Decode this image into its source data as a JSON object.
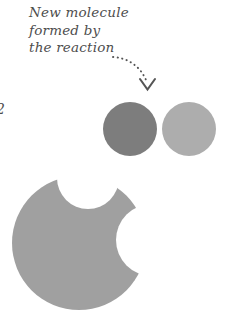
{
  "canvas": {
    "width": 227,
    "height": 318,
    "background": "#ffffff"
  },
  "annotation": {
    "lines": [
      "New molecule",
      "formed by",
      "the reaction"
    ],
    "color": "#4d4d4d"
  },
  "figure_number": {
    "label": "2"
  },
  "arrow": {
    "name": "dotted-curved-arrow",
    "style": "dotted",
    "color": "#555555",
    "start_x": 113,
    "start_y": 57,
    "end_x": 148,
    "end_y": 84,
    "arrowhead": "v-chevron"
  },
  "shapes": {
    "small_atom_dark": {
      "label": "dark atom",
      "cx": 130,
      "cy": 129,
      "r": 27,
      "color": "#7d7d7d"
    },
    "small_atom_light": {
      "label": "light atom",
      "cx": 189,
      "cy": 129,
      "r": 27,
      "color": "#adadad"
    },
    "large_molecule": {
      "label": "large molecule with two notches",
      "cx": 79,
      "cy": 243,
      "r": 67,
      "color": "#a0a0a0",
      "notch_top": {
        "cx": 88,
        "cy": 178,
        "r": 31
      },
      "notch_right": {
        "cx": 152,
        "cy": 240,
        "r": 36
      }
    }
  }
}
